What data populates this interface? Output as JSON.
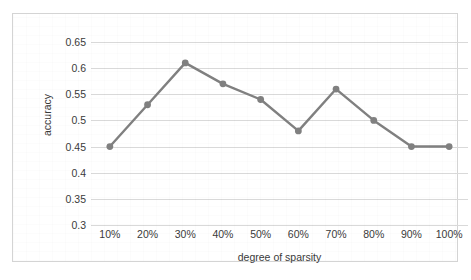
{
  "chart_data": {
    "type": "line",
    "title": "",
    "subtitle": "",
    "xlabel": "degree of sparsity",
    "ylabel": "accuracy",
    "categories": [
      "10%",
      "20%",
      "30%",
      "40%",
      "50%",
      "60%",
      "70%",
      "80%",
      "90%",
      "100%"
    ],
    "values": [
      0.45,
      0.53,
      0.61,
      0.57,
      0.54,
      0.48,
      0.56,
      0.5,
      0.45,
      0.45
    ],
    "series": [
      {
        "name": "accuracy",
        "values": [
          0.45,
          0.53,
          0.61,
          0.57,
          0.54,
          0.48,
          0.56,
          0.5,
          0.45,
          0.45
        ]
      }
    ],
    "ylim": [
      0.3,
      0.65
    ],
    "ytick_labels": [
      "0.3",
      "0.35",
      "0.4",
      "0.45",
      "0.5",
      "0.55",
      "0.6",
      "0.65"
    ],
    "ytick_values": [
      0.3,
      0.35,
      0.4,
      0.45,
      0.5,
      0.55,
      0.6,
      0.65
    ],
    "grid": "horizontal",
    "legend": "none",
    "marker": "circle",
    "line_color": "#808080",
    "marker_color": "#808080",
    "gridline_color": "#d9d9d9",
    "border_color": "#d4d4d4",
    "background_color": "#ffffff",
    "text_color": "#3a3a3a",
    "annotations": []
  }
}
